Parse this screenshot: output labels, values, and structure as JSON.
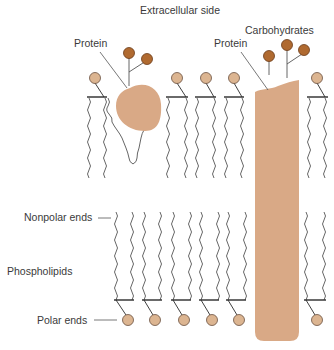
{
  "title": "Extracellular side",
  "labels": {
    "protein_left": "Protein",
    "protein_right": "Protein",
    "carbohydrates": "Carbohydrates",
    "nonpolar_ends": "Nonpolar ends",
    "phospholipids": "Phospholipids",
    "polar_ends": "Polar ends"
  },
  "colors": {
    "head_fill": "#dcb591",
    "head_stroke": "#6a5040",
    "carbohydrate_fill": "#b06a30",
    "carbohydrate_stroke": "#6a3a18",
    "protein_fill": "#d9a986",
    "line": "#2a2a2a",
    "tail": "#555555"
  },
  "top_layer_heads_x": [
    95,
    177,
    206,
    234,
    317
  ],
  "bottom_layer_heads_x": [
    128,
    155,
    184,
    212,
    239,
    317
  ]
}
